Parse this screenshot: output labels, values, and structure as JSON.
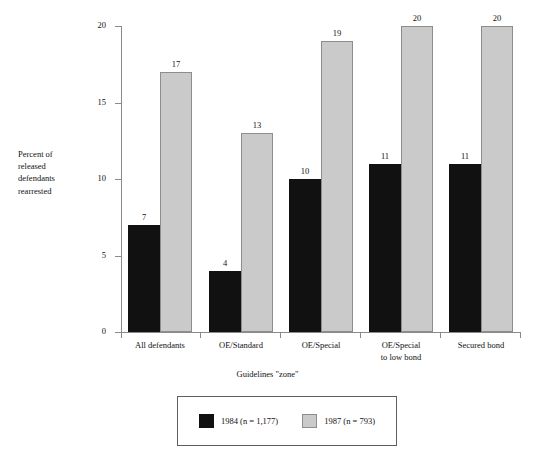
{
  "chart_data": {
    "type": "bar",
    "title": "",
    "xlabel": "Guidelines \"zone\"",
    "ylabel": "Percent of released defendants rearrested",
    "ylabel_lines": [
      "Percent of",
      "released",
      "defendants",
      "rearrested"
    ],
    "ylim": [
      0,
      20
    ],
    "yticks": [
      0,
      5,
      10,
      15,
      20
    ],
    "ytick_labels": [
      "0",
      "5",
      "10",
      "15",
      "20"
    ],
    "grid": false,
    "legend_position": "bottom",
    "categories": [
      "All defendants",
      "OE/Standard",
      "OE/Special",
      "OE/Special\nto low bond",
      "Secured bond"
    ],
    "series": [
      {
        "name": "1984 (n = 1,177)",
        "color": "#111111",
        "values": [
          7,
          4,
          10,
          11,
          11
        ],
        "value_labels": [
          "7",
          "4",
          "10",
          "11",
          "11"
        ]
      },
      {
        "name": "1987 (n = 793)",
        "color": "#cacaca",
        "values": [
          17,
          13,
          19,
          20,
          20
        ],
        "value_labels": [
          "17",
          "13",
          "19",
          "20",
          "20"
        ]
      }
    ]
  },
  "axes": {
    "y_title_lines": [
      "Percent of",
      "released",
      "defendants",
      "rearrested"
    ],
    "x_title": "Guidelines \"zone\"",
    "y_tick_0": "0",
    "y_tick_1": "5",
    "y_tick_2": "10",
    "y_tick_3": "15",
    "y_tick_4": "20"
  },
  "categories": {
    "c0": "All defendants",
    "c1": "OE/Standard",
    "c2": "OE/Special",
    "c3": "OE/Special\nto low bond",
    "c4": "Secured bond"
  },
  "bar_labels": {
    "g0_1984": "7",
    "g0_1987": "17",
    "g1_1984": "4",
    "g1_1987": "13",
    "g2_1984": "10",
    "g2_1987": "19",
    "g3_1984": "11",
    "g3_1987": "20",
    "g4_1984": "11",
    "g4_1987": "20"
  },
  "legend": {
    "item1_label": "1984 (n = 1,177)",
    "item2_label": "1987 (n = 793)",
    "item1_color": "#111111",
    "item2_color": "#cacaca"
  }
}
